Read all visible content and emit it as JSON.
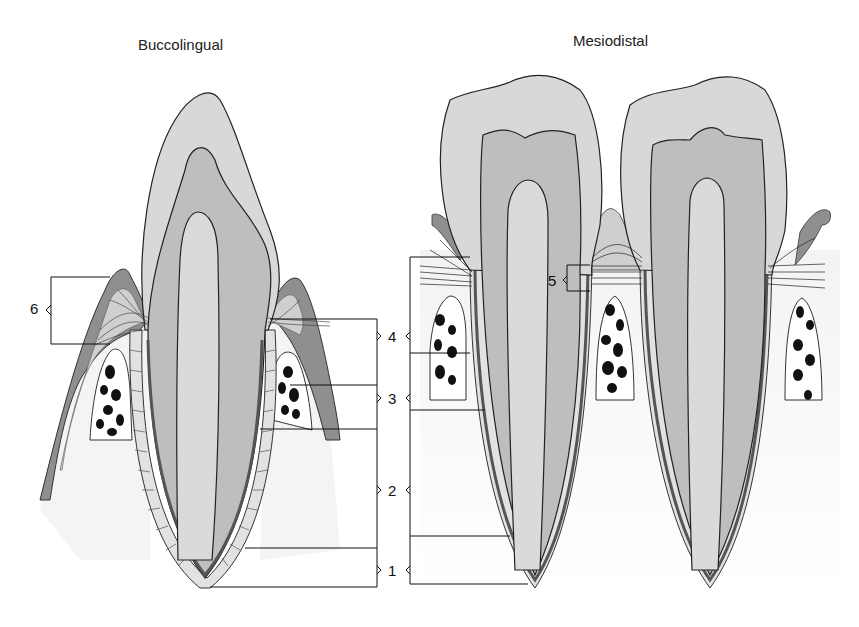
{
  "titles": {
    "left": "Buccolingual",
    "right": "Mesiodistal"
  },
  "labels": {
    "l1": "1",
    "l2": "2",
    "l3": "3",
    "l4": "4",
    "l5": "5",
    "l6": "6"
  },
  "colors": {
    "enamel": "#d6d6d6",
    "dentin": "#bdbdbd",
    "pulp": "#dcdcdc",
    "gingiva": "#9a9a9a",
    "fibers": "#cfcfcf",
    "bone_cavity": "#111111",
    "outline": "#222222",
    "background": "#ffffff"
  }
}
